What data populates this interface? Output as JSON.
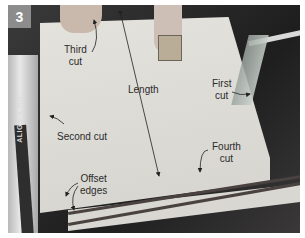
{
  "figure": {
    "step_number": "3",
    "fence_brand_text": "ALIGN-A-RIP",
    "labels": {
      "third_cut": [
        "Third",
        "cut"
      ],
      "length": "Length",
      "first_cut": [
        "First",
        "cut"
      ],
      "second_cut": "Second cut",
      "fourth_cut": [
        "Fourth",
        "cut"
      ],
      "offset_edges": [
        "Offset",
        "edges"
      ]
    },
    "colors": {
      "badge_bg": "#8c8c8c",
      "badge_text": "#ffffff",
      "label_text": "#2b2b2b",
      "panel": "#dcdad5"
    }
  }
}
